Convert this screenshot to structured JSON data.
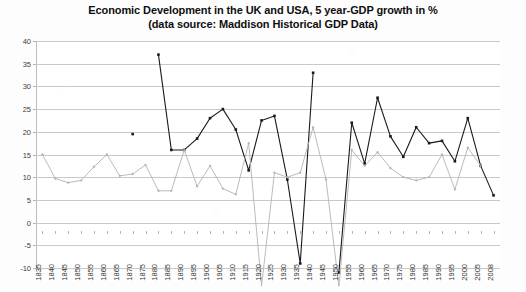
{
  "chart_data": {
    "type": "line",
    "title": "Economic Development in the UK and USA, 5 year-GDP growth in %",
    "subtitle": "(data source: Maddison Historical GDP Data)",
    "xlabel": "",
    "ylabel": "",
    "ylim": [
      -10,
      40
    ],
    "ytick_step": 5,
    "yticks": [
      40,
      35,
      30,
      25,
      20,
      15,
      10,
      5,
      0,
      -5,
      -10
    ],
    "grid": true,
    "legend": "none",
    "categories": [
      "1835",
      "1840",
      "1845",
      "1850",
      "1855",
      "1860",
      "1865",
      "1870",
      "1875",
      "1880",
      "1885",
      "1890",
      "1895",
      "1900",
      "1905",
      "1910",
      "1915",
      "1920",
      "1925",
      "1930",
      "1935",
      "1940",
      "1945",
      "1950",
      "1955",
      "1960",
      "1965",
      "1970",
      "1975",
      "1980",
      "1985",
      "1990",
      "1995",
      "2000",
      "2005",
      "2008"
    ],
    "series": [
      {
        "name": "dark-series",
        "color": "#1a1a1a",
        "marker": "square",
        "values": [
          null,
          null,
          null,
          null,
          null,
          null,
          null,
          19.5,
          null,
          37.0,
          16.0,
          16.0,
          18.5,
          23.0,
          25.0,
          20.5,
          11.5,
          22.5,
          23.5,
          9.5,
          -9.0,
          33.0,
          null,
          -11.0,
          22.0,
          13.0,
          27.5,
          19.0,
          14.5,
          21.0,
          17.5,
          18.0,
          13.5,
          23.0,
          12.5,
          6.0
        ]
      },
      {
        "name": "grey-series",
        "color": "#b3b3b3",
        "marker": "diamond",
        "values": [
          15.0,
          9.7,
          8.8,
          9.3,
          12.3,
          15.0,
          10.3,
          10.7,
          12.7,
          7.0,
          7.0,
          16.0,
          8.0,
          12.5,
          7.5,
          6.2,
          17.5,
          -14.0,
          11.0,
          10.0,
          11.0,
          21.0,
          9.5,
          -14.0,
          16.0,
          12.5,
          15.5,
          12.0,
          10.0,
          9.3,
          10.0,
          15.0,
          7.3,
          16.5,
          12.5,
          null
        ]
      }
    ]
  }
}
